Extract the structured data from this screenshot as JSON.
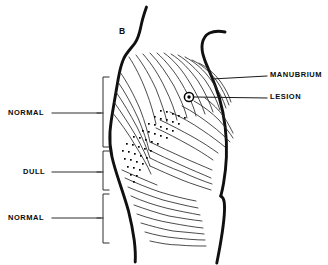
{
  "figure": {
    "panel_label": "B",
    "ink_color": "#0b0b0b",
    "background_color": "#ffffff",
    "line_color": "#1a1a1a",
    "stipple_color": "#000000"
  },
  "left_annotations": {
    "bracket_regions": [
      {
        "label": "NORMAL",
        "label_x": 8,
        "label_y": 110,
        "bracket_top": 77,
        "bracket_bottom": 147,
        "tick_y": 113,
        "leader_from_x": 52,
        "leader_to_x": 101
      },
      {
        "label": "DULL",
        "label_x": 22,
        "label_y": 169,
        "bracket_top": 151,
        "bracket_bottom": 190,
        "tick_y": 172,
        "leader_from_x": 52,
        "leader_to_x": 101
      },
      {
        "label": "NORMAL",
        "label_x": 8,
        "label_y": 215,
        "bracket_top": 194,
        "bracket_bottom": 243,
        "tick_y": 218,
        "leader_from_x": 52,
        "leader_to_x": 101
      }
    ],
    "bracket_x": 103,
    "bracket_arm": 6
  },
  "right_annotations": {
    "items": [
      {
        "label": "MANUBRIUM",
        "label_x": 270,
        "label_y": 72,
        "leader_from_x": 212,
        "leader_from_y": 79,
        "leader_to_x": 267,
        "leader_to_y": 76
      },
      {
        "label": "LESION",
        "label_x": 270,
        "label_y": 94,
        "leader_from_x": 196,
        "leader_from_y": 97,
        "leader_to_x": 267,
        "leader_to_y": 98
      }
    ]
  },
  "anatomy": {
    "lesion_marker": {
      "name": "lesion",
      "center_x": 189,
      "center_y": 97,
      "outer_radius": 4.6,
      "inner_radius": 1.7
    },
    "panel_label_position": {
      "x": 119,
      "y": 31
    }
  }
}
